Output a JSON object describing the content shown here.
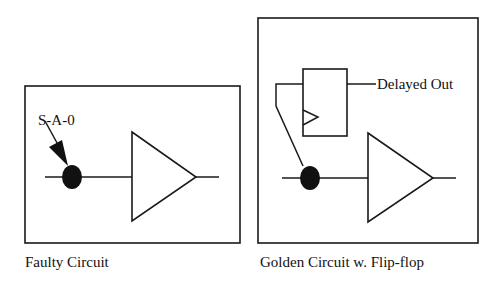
{
  "left_panel": {
    "caption": "Faulty Circuit",
    "fault_label": "S-A-0"
  },
  "right_panel": {
    "caption": "Golden Circuit w. Flip-flop",
    "output_label": "Delayed Out"
  },
  "colors": {
    "stroke": "#1a1a1a",
    "background": "#ffffff"
  }
}
